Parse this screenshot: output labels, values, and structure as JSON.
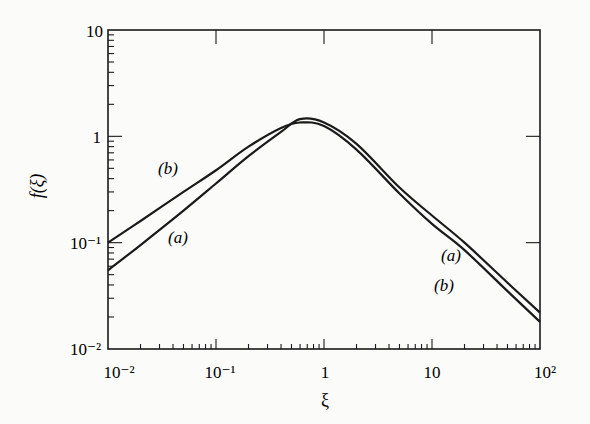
{
  "chart_data": {
    "type": "line",
    "title": "",
    "xlabel": "ξ",
    "ylabel": "f(ξ)",
    "xscale": "log",
    "yscale": "log",
    "xlim": [
      0.01,
      100
    ],
    "ylim": [
      0.01,
      10
    ],
    "x_ticks": [
      "10⁻²",
      "10⁻¹",
      "1",
      "10",
      "10²"
    ],
    "y_ticks": [
      "10⁻²",
      "10⁻¹",
      "1",
      "10"
    ],
    "grid": false,
    "legend": "none (inline curve labels)",
    "series": [
      {
        "name": "(a)",
        "x": [
          0.01,
          0.02,
          0.05,
          0.1,
          0.2,
          0.4,
          0.6,
          1,
          2,
          5,
          10,
          20,
          50,
          100
        ],
        "y": [
          0.055,
          0.095,
          0.2,
          0.36,
          0.65,
          1.1,
          1.45,
          1.35,
          0.85,
          0.33,
          0.18,
          0.1,
          0.042,
          0.022
        ]
      },
      {
        "name": "(b)",
        "x": [
          0.01,
          0.02,
          0.05,
          0.1,
          0.2,
          0.4,
          0.6,
          1,
          2,
          5,
          10,
          20,
          50,
          100
        ],
        "y": [
          0.1,
          0.16,
          0.3,
          0.48,
          0.8,
          1.2,
          1.35,
          1.25,
          0.75,
          0.29,
          0.15,
          0.085,
          0.035,
          0.018
        ]
      }
    ],
    "annotations": [
      {
        "text": "(b)",
        "near": "left branch, upper curve"
      },
      {
        "text": "(a)",
        "near": "left branch, lower curve"
      },
      {
        "text": "(a)",
        "near": "right branch, upper curve"
      },
      {
        "text": "(b)",
        "near": "right branch, lower curve"
      }
    ]
  },
  "labels": {
    "xlabel": "ξ",
    "ylabel": "f(ξ)",
    "x_ticks": [
      "10⁻²",
      "10⁻¹",
      "1",
      "10",
      "10²"
    ],
    "y_ticks": [
      "10⁻²",
      "10⁻¹",
      "1",
      "10"
    ],
    "curve_a_left": "(a)",
    "curve_b_left": "(b)",
    "curve_a_right": "(a)",
    "curve_b_right": "(b)"
  }
}
